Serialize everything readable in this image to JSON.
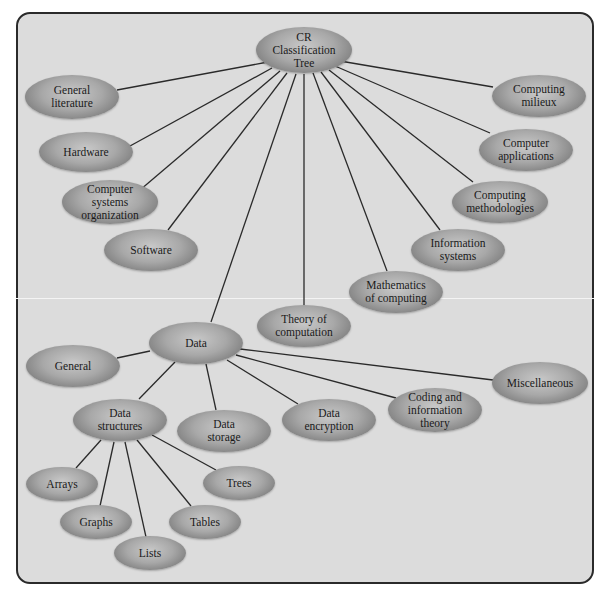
{
  "diagram": {
    "type": "tree",
    "title": "CR Classification Tree",
    "root": {
      "id": "root",
      "label": "CR\nClassification\nTree"
    },
    "nodes": [
      {
        "id": "root",
        "label": "CR\nClassification\nTree",
        "x": 304,
        "y": 50,
        "w": 96,
        "h": 46
      },
      {
        "id": "general-literature",
        "label": "General\nliterature",
        "x": 72,
        "y": 97,
        "w": 94,
        "h": 44
      },
      {
        "id": "hardware",
        "label": "Hardware",
        "x": 86,
        "y": 152,
        "w": 94,
        "h": 40
      },
      {
        "id": "computer-systems-organization",
        "label": "Computer\nsystems\norganization",
        "x": 110,
        "y": 202,
        "w": 96,
        "h": 44
      },
      {
        "id": "software",
        "label": "Software",
        "x": 151,
        "y": 250,
        "w": 94,
        "h": 42
      },
      {
        "id": "computing-milieux",
        "label": "Computing\nmilieux",
        "x": 539,
        "y": 96,
        "w": 94,
        "h": 42
      },
      {
        "id": "computer-applications",
        "label": "Computer\napplications",
        "x": 526,
        "y": 150,
        "w": 94,
        "h": 42
      },
      {
        "id": "computing-methodologies",
        "label": "Computing\nmethodologies",
        "x": 500,
        "y": 202,
        "w": 96,
        "h": 42
      },
      {
        "id": "information-systems",
        "label": "Information\nsystems",
        "x": 458,
        "y": 250,
        "w": 94,
        "h": 42
      },
      {
        "id": "mathematics-of-computing",
        "label": "Mathematics\nof computing",
        "x": 396,
        "y": 292,
        "w": 94,
        "h": 42
      },
      {
        "id": "theory-of-computation",
        "label": "Theory of\ncomputation",
        "x": 304,
        "y": 326,
        "w": 94,
        "h": 42
      },
      {
        "id": "data",
        "label": "Data",
        "x": 196,
        "y": 343,
        "w": 94,
        "h": 42
      },
      {
        "id": "general",
        "label": "General",
        "x": 73,
        "y": 366,
        "w": 94,
        "h": 42
      },
      {
        "id": "data-structures",
        "label": "Data\nstructures",
        "x": 120,
        "y": 420,
        "w": 94,
        "h": 42
      },
      {
        "id": "data-storage",
        "label": "Data\nstorage",
        "x": 224,
        "y": 431,
        "w": 94,
        "h": 42
      },
      {
        "id": "data-encryption",
        "label": "Data\nencryption",
        "x": 329,
        "y": 420,
        "w": 94,
        "h": 42
      },
      {
        "id": "coding-and-information-theory",
        "label": "Coding and\ninformation\ntheory",
        "x": 435,
        "y": 410,
        "w": 94,
        "h": 44
      },
      {
        "id": "miscellaneous",
        "label": "Miscellaneous",
        "x": 540,
        "y": 383,
        "w": 96,
        "h": 42
      },
      {
        "id": "arrays",
        "label": "Arrays",
        "x": 62,
        "y": 484,
        "w": 72,
        "h": 34
      },
      {
        "id": "graphs",
        "label": "Graphs",
        "x": 96,
        "y": 522,
        "w": 72,
        "h": 34
      },
      {
        "id": "lists",
        "label": "Lists",
        "x": 150,
        "y": 553,
        "w": 72,
        "h": 34
      },
      {
        "id": "tables",
        "label": "Tables",
        "x": 205,
        "y": 522,
        "w": 72,
        "h": 34
      },
      {
        "id": "trees",
        "label": "Trees",
        "x": 239,
        "y": 483,
        "w": 72,
        "h": 34
      }
    ],
    "edges": [
      {
        "from": "root",
        "to": "general-literature",
        "x1": 268,
        "y1": 62,
        "x2": 117,
        "y2": 90
      },
      {
        "from": "root",
        "to": "hardware",
        "x1": 272,
        "y1": 68,
        "x2": 130,
        "y2": 146
      },
      {
        "from": "root",
        "to": "computer-systems-organization",
        "x1": 280,
        "y1": 71,
        "x2": 140,
        "y2": 190
      },
      {
        "from": "root",
        "to": "software",
        "x1": 287,
        "y1": 73,
        "x2": 168,
        "y2": 230
      },
      {
        "from": "root",
        "to": "data",
        "x1": 296,
        "y1": 74,
        "x2": 211,
        "y2": 322
      },
      {
        "from": "root",
        "to": "theory-of-computation",
        "x1": 304,
        "y1": 74,
        "x2": 304,
        "y2": 305
      },
      {
        "from": "root",
        "to": "mathematics-of-computing",
        "x1": 313,
        "y1": 73,
        "x2": 387,
        "y2": 271
      },
      {
        "from": "root",
        "to": "information-systems",
        "x1": 321,
        "y1": 72,
        "x2": 440,
        "y2": 230
      },
      {
        "from": "root",
        "to": "computing-methodologies",
        "x1": 329,
        "y1": 70,
        "x2": 473,
        "y2": 182
      },
      {
        "from": "root",
        "to": "computer-applications",
        "x1": 335,
        "y1": 66,
        "x2": 490,
        "y2": 133
      },
      {
        "from": "root",
        "to": "computing-milieux",
        "x1": 340,
        "y1": 61,
        "x2": 493,
        "y2": 87
      },
      {
        "from": "data",
        "to": "general",
        "x1": 150,
        "y1": 351,
        "x2": 117,
        "y2": 358
      },
      {
        "from": "data",
        "to": "data-structures",
        "x1": 175,
        "y1": 362,
        "x2": 139,
        "y2": 399
      },
      {
        "from": "data",
        "to": "data-storage",
        "x1": 206,
        "y1": 364,
        "x2": 216,
        "y2": 410
      },
      {
        "from": "data",
        "to": "data-encryption",
        "x1": 227,
        "y1": 360,
        "x2": 298,
        "y2": 404
      },
      {
        "from": "data",
        "to": "coding-and-information-theory",
        "x1": 236,
        "y1": 355,
        "x2": 396,
        "y2": 398
      },
      {
        "from": "data",
        "to": "miscellaneous",
        "x1": 240,
        "y1": 349,
        "x2": 493,
        "y2": 380
      },
      {
        "from": "data-structures",
        "to": "arrays",
        "x1": 101,
        "y1": 440,
        "x2": 76,
        "y2": 468
      },
      {
        "from": "data-structures",
        "to": "graphs",
        "x1": 114,
        "y1": 442,
        "x2": 100,
        "y2": 506
      },
      {
        "from": "data-structures",
        "to": "lists",
        "x1": 125,
        "y1": 442,
        "x2": 146,
        "y2": 537
      },
      {
        "from": "data-structures",
        "to": "tables",
        "x1": 137,
        "y1": 440,
        "x2": 191,
        "y2": 506
      },
      {
        "from": "data-structures",
        "to": "trees",
        "x1": 152,
        "y1": 435,
        "x2": 216,
        "y2": 470
      }
    ]
  },
  "colors": {
    "panel_bg": "#dcdcdc",
    "panel_border": "#2a2a2a",
    "edge": "#2a2a2a",
    "node_light": "#c8c8c8",
    "node_dark": "#6a6a6a",
    "text": "#1a1a1a"
  }
}
